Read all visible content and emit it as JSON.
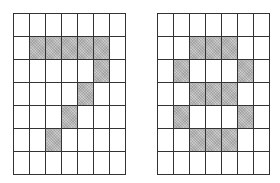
{
  "grids": [
    {
      "name": "digit-seven-grid",
      "rows": 7,
      "cols": 7,
      "fill_color": "#b8b8b8",
      "cells": [
        [
          0,
          0,
          0,
          0,
          0,
          0,
          0
        ],
        [
          0,
          1,
          1,
          1,
          1,
          1,
          0
        ],
        [
          0,
          0,
          0,
          0,
          0,
          1,
          0
        ],
        [
          0,
          0,
          0,
          0,
          1,
          0,
          0
        ],
        [
          0,
          0,
          0,
          1,
          0,
          0,
          0
        ],
        [
          0,
          0,
          1,
          0,
          0,
          0,
          0
        ],
        [
          0,
          0,
          0,
          0,
          0,
          0,
          0
        ]
      ]
    },
    {
      "name": "digit-eight-grid",
      "rows": 7,
      "cols": 7,
      "fill_color": "#b8b8b8",
      "cells": [
        [
          0,
          0,
          0,
          0,
          0,
          0,
          0
        ],
        [
          0,
          0,
          1,
          1,
          1,
          0,
          0
        ],
        [
          0,
          1,
          0,
          0,
          0,
          1,
          0
        ],
        [
          0,
          0,
          1,
          1,
          1,
          0,
          0
        ],
        [
          0,
          1,
          0,
          0,
          0,
          1,
          0
        ],
        [
          0,
          0,
          1,
          1,
          1,
          0,
          0
        ],
        [
          0,
          0,
          0,
          0,
          0,
          0,
          0
        ]
      ]
    }
  ]
}
